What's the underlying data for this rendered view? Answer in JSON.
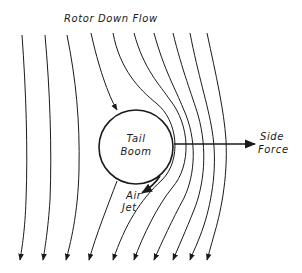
{
  "diagram": {
    "title": "Rotor Down Flow",
    "body_label_line1": "Tail",
    "body_label_line2": "Boom",
    "force_label_line1": "Side",
    "force_label_line2": "Force",
    "jet_label_line1": "Air",
    "jet_label_line2": "Jet",
    "streamline_count": 10,
    "colors": {
      "ink": "#1a1a1a",
      "background": "#ffffff"
    }
  }
}
